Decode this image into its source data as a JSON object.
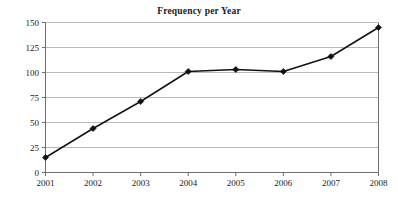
{
  "chart_data": {
    "type": "line",
    "title": "Frequency per Year",
    "xlabel": "",
    "ylabel": "",
    "categories": [
      "2001",
      "2002",
      "2003",
      "2004",
      "2005",
      "2006",
      "2007",
      "2008"
    ],
    "values": [
      15,
      44,
      71,
      101,
      103,
      101,
      116,
      145
    ],
    "series": [
      {
        "name": "Frequency",
        "values": [
          15,
          44,
          71,
          101,
          103,
          101,
          116,
          145
        ]
      }
    ],
    "ylim": [
      0,
      150
    ],
    "ytick_labels": [
      "0",
      "25",
      "50",
      "75",
      "100",
      "125",
      "150"
    ],
    "ytick_values": [
      0,
      25,
      50,
      75,
      100,
      125,
      150
    ],
    "xtick_labels": [
      "2001",
      "2002",
      "2003",
      "2004",
      "2005",
      "2006",
      "2007",
      "2008"
    ],
    "grid": true,
    "grid_axis": "y",
    "legend": false,
    "legend_position": "none",
    "marker": "diamond",
    "line_color": "#111111",
    "marker_color": "#111111",
    "grid_color": "#9a9a9a",
    "axis_color": "#6e6e6e",
    "background_color": "#ffffff",
    "title_color": "#1a1a1a"
  }
}
